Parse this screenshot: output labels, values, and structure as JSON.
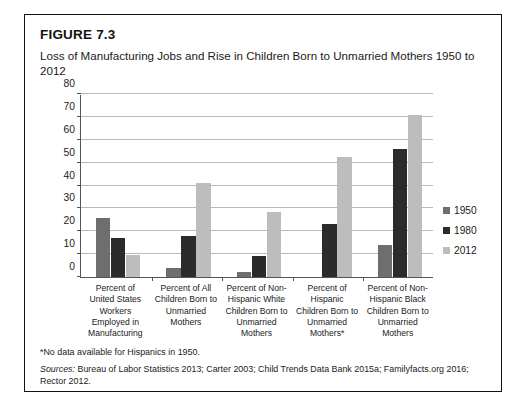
{
  "figure": {
    "number": "FIGURE 7.3",
    "title": "Loss of Manufacturing Jobs and Rise in Children Born to Unmarried Mothers 1950 to 2012",
    "footnote": "*No data available for Hispanics in 1950.",
    "sources_label": "Sources:",
    "sources_text": " Bureau of Labor Statistics 2013; Carter 2003; Child Trends Data Bank 2015a; Familyfacts.org 2016; Rector 2012."
  },
  "colors": {
    "series_1950": "#6e6e6e",
    "series_1980": "#2b2b2b",
    "series_2012": "#bdbdbd",
    "gridline": "#b9b9b9",
    "axis": "#555555",
    "frame": "#111111",
    "text": "#1a1a1a"
  },
  "chart_data": {
    "type": "bar",
    "title": "Loss of Manufacturing Jobs and Rise in Children Born to Unmarried Mothers 1950 to 2012",
    "xlabel": "",
    "ylabel": "",
    "ylim": [
      0,
      80
    ],
    "yticks": [
      0,
      10,
      20,
      30,
      40,
      50,
      60,
      70,
      80
    ],
    "ytick_labels": [
      "0",
      "10",
      "20",
      "30",
      "40",
      "50",
      "60",
      "70",
      "80"
    ],
    "grid": true,
    "legend_position": "right",
    "categories": [
      "Percent of United States Workers Employed in Manufacturing",
      "Percent of All Children Born to Unmarried Mothers",
      "Percent of Non-Hispanic White Children Born to Unmarried Mothers",
      "Percent of Hispanic Children Born to Unmarried Mothers*",
      "Percent of Non-Hispanic Black Children Born to Unmarried Mothers"
    ],
    "category_lines": [
      [
        "Percent of",
        "United States",
        "Workers",
        "Employed in",
        "Manufacturing"
      ],
      [
        "Percent of All",
        "Children Born to",
        "Unmarried",
        "Mothers"
      ],
      [
        "Percent of Non-",
        "Hispanic White",
        "Children Born to",
        "Unmarried",
        "Mothers"
      ],
      [
        "Percent of",
        "Hispanic",
        "Children Born to",
        "Unmarried",
        "Mothers*"
      ],
      [
        "Percent of Non-",
        "Hispanic Black",
        "Children Born to",
        "Unmarried",
        "Mothers"
      ]
    ],
    "series": [
      {
        "name": "1950",
        "color": "#6e6e6e",
        "values": [
          26,
          4,
          2,
          null,
          14
        ]
      },
      {
        "name": "1980",
        "color": "#2b2b2b",
        "values": [
          17,
          18,
          9,
          23,
          56
        ]
      },
      {
        "name": "2012",
        "color": "#bdbdbd",
        "values": [
          9.5,
          41,
          28.5,
          52.5,
          71
        ]
      }
    ]
  },
  "legend": {
    "items": [
      {
        "label": "1950",
        "color": "#6e6e6e"
      },
      {
        "label": "1980",
        "color": "#2b2b2b"
      },
      {
        "label": "2012",
        "color": "#bdbdbd"
      }
    ]
  }
}
